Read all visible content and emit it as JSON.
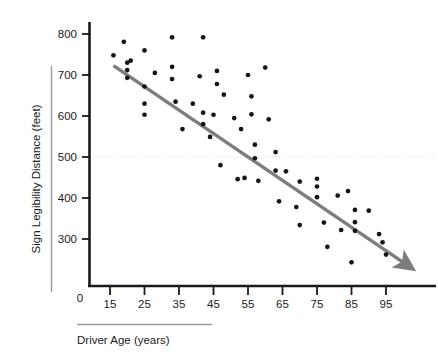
{
  "chart_data": {
    "type": "scatter",
    "title": "",
    "xlabel": "Driver Age (years)",
    "ylabel": "Sign Legibility Distance (feet)",
    "xlim": [
      10,
      100
    ],
    "ylim": [
      200,
      830
    ],
    "xticks": [
      15,
      25,
      35,
      45,
      55,
      65,
      75,
      85,
      95
    ],
    "yticks": [
      300,
      400,
      500,
      600,
      700,
      800
    ],
    "origin_label": "0",
    "grid": false,
    "legend": "none",
    "point_color": "#141414",
    "trend_color": "#7d7d7d",
    "reference_line_color": "#dcdcdc",
    "axis_color": "#1a1a1a",
    "reference_line": {
      "y": 500,
      "style": "dotted",
      "label": ""
    },
    "trend_line": {
      "x_start": 16,
      "y_start": 723,
      "x_end": 100,
      "y_end": 243,
      "arrow_end": true
    },
    "series": [
      {
        "name": "Drivers",
        "points": [
          [
            16,
            748
          ],
          [
            19,
            781
          ],
          [
            20,
            730
          ],
          [
            20,
            712
          ],
          [
            21,
            735
          ],
          [
            25,
            760
          ],
          [
            25,
            672
          ],
          [
            25,
            630
          ],
          [
            25,
            603
          ],
          [
            28,
            705
          ],
          [
            20,
            693
          ],
          [
            33,
            792
          ],
          [
            33,
            720
          ],
          [
            33,
            690
          ],
          [
            34,
            635
          ],
          [
            36,
            568
          ],
          [
            39,
            630
          ],
          [
            41,
            697
          ],
          [
            42,
            792
          ],
          [
            42,
            608
          ],
          [
            42,
            580
          ],
          [
            44,
            549
          ],
          [
            45,
            603
          ],
          [
            46,
            710
          ],
          [
            46,
            678
          ],
          [
            47,
            480
          ],
          [
            48,
            652
          ],
          [
            51,
            595
          ],
          [
            52,
            446
          ],
          [
            53,
            568
          ],
          [
            54,
            449
          ],
          [
            55,
            700
          ],
          [
            56,
            604
          ],
          [
            56,
            648
          ],
          [
            57,
            530
          ],
          [
            57,
            497
          ],
          [
            58,
            442
          ],
          [
            60,
            718
          ],
          [
            61,
            592
          ],
          [
            63,
            512
          ],
          [
            63,
            467
          ],
          [
            64,
            392
          ],
          [
            66,
            465
          ],
          [
            69,
            378
          ],
          [
            70,
            440
          ],
          [
            70,
            334
          ],
          [
            75,
            447
          ],
          [
            75,
            428
          ],
          [
            75,
            402
          ],
          [
            77,
            340
          ],
          [
            78,
            281
          ],
          [
            81,
            406
          ],
          [
            82,
            322
          ],
          [
            84,
            417
          ],
          [
            85,
            243
          ],
          [
            86,
            341
          ],
          [
            86,
            320
          ],
          [
            86,
            371
          ],
          [
            90,
            369
          ],
          [
            93,
            312
          ],
          [
            94,
            292
          ],
          [
            95,
            262
          ]
        ]
      }
    ]
  },
  "axis": {
    "y_title": "Sign Legibility Distance (feet)",
    "x_title": "Driver Age (years)",
    "origin": "0",
    "y_tick_labels": [
      "800",
      "700",
      "600",
      "500",
      "400",
      "300"
    ],
    "x_tick_labels": [
      "15",
      "25",
      "35",
      "45",
      "55",
      "65",
      "75",
      "85",
      "95"
    ]
  }
}
